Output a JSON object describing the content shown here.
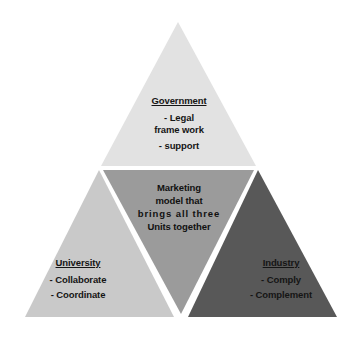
{
  "diagram": {
    "background_color": "#ffffff",
    "shape": "triangle",
    "apex": {
      "x": 178,
      "y": 22
    },
    "bottom_left": {
      "x": 25,
      "y": 317
    },
    "bottom_right": {
      "x": 337,
      "y": 317
    },
    "divider_color": "#ffffff",
    "text_color": "#151515",
    "regions": [
      {
        "id": "government",
        "name": "Government",
        "position": "top",
        "fill": "#e2e2e2",
        "title": "Government",
        "items": [
          "- Legal",
          "frame work",
          "- support"
        ]
      },
      {
        "id": "center",
        "name": "Marketing model",
        "position": "center",
        "fill": "#9b9b9b",
        "lines": [
          "Marketing",
          "model that",
          "brings all three",
          "Units together"
        ]
      },
      {
        "id": "university",
        "name": "University",
        "position": "bottom-left",
        "fill": "#c9c9c9",
        "title": "University",
        "items": [
          "- Collaborate",
          "- Coordinate"
        ]
      },
      {
        "id": "industry",
        "name": "Industry",
        "position": "bottom-right",
        "fill": "#585858",
        "title": "Industry",
        "items": [
          "- Comply",
          "- Complement"
        ]
      }
    ]
  }
}
